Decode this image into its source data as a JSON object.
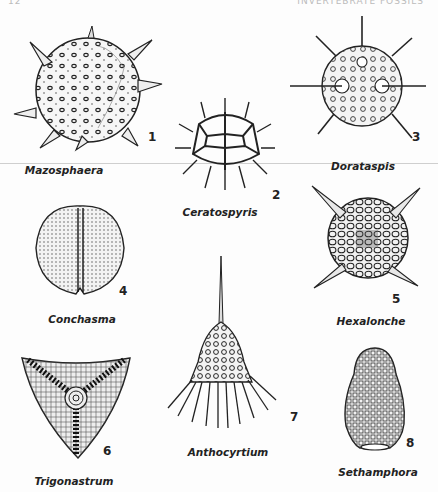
{
  "page": {
    "page_number": "12",
    "running_head": "INVERTEBRATE FOSSILS"
  },
  "figures": [
    {
      "number": "1",
      "name": "Mazosphaera"
    },
    {
      "number": "2",
      "name": "Ceratospyris"
    },
    {
      "number": "3",
      "name": "Dorataspis"
    },
    {
      "number": "4",
      "name": "Conchasma"
    },
    {
      "number": "5",
      "name": "Hexalonche"
    },
    {
      "number": "6",
      "name": "Trigonastrum"
    },
    {
      "number": "7",
      "name": "Anthocyrtium"
    },
    {
      "number": "8",
      "name": "Sethamphora"
    }
  ]
}
